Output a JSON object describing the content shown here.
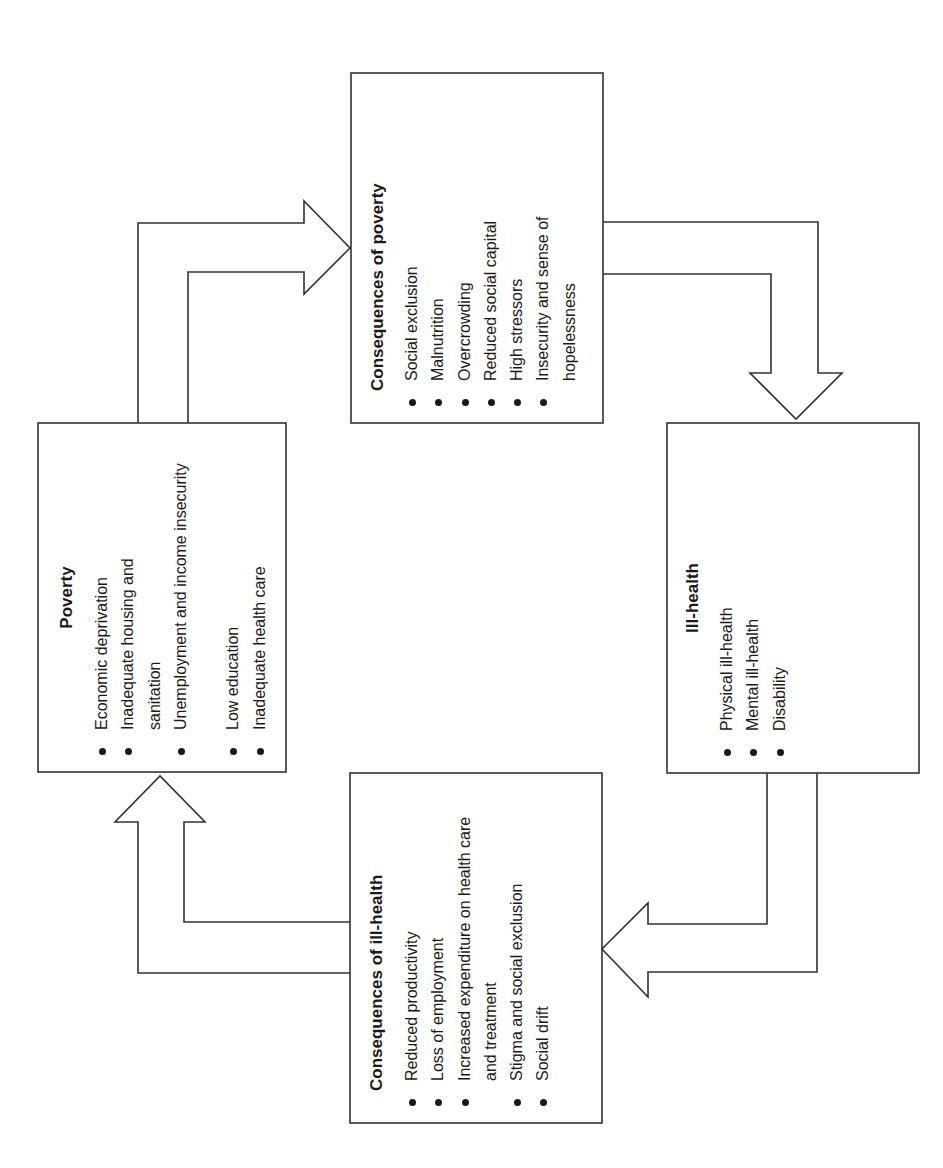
{
  "diagram": {
    "orientation": "rotated -90deg (text reads bottom-to-top)",
    "line_color": "#333333",
    "boxes": {
      "poverty": {
        "title": "Poverty",
        "items": [
          "Economic deprivation",
          "Inadequate housing and sanitation",
          "Unemployment and income insecurity",
          "Low education",
          "Inadequate health care"
        ]
      },
      "consequences_of_poverty": {
        "title": "Consequences of poverty",
        "items": [
          "Social exclusion",
          "Malnutrition",
          "Overcrowding",
          "Reduced social capital",
          "High stressors",
          "Insecurity and sense of hopelessness"
        ]
      },
      "ill_health": {
        "title": "Ill-health",
        "items": [
          "Physical ill-health",
          "Mental ill-health",
          "Disability"
        ]
      },
      "consequences_of_ill_health": {
        "title": "Consequences of ill-health",
        "items": [
          "Reduced productivity",
          "Loss of employment",
          "Increased expenditure on health care and treatment",
          "Stigma and social exclusion",
          "Social drift"
        ]
      }
    },
    "arrows": [
      {
        "from": "Poverty",
        "to": "Consequences of poverty"
      },
      {
        "from": "Consequences of poverty",
        "to": "Ill-health"
      },
      {
        "from": "Ill-health",
        "to": "Consequences of ill-health"
      },
      {
        "from": "Consequences of ill-health",
        "to": "Poverty"
      }
    ]
  }
}
